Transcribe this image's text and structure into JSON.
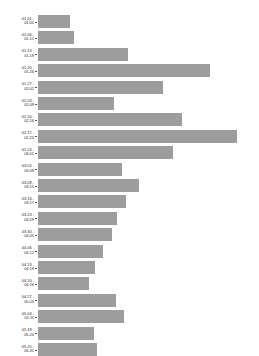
{
  "chart_data": {
    "type": "bar",
    "orientation": "horizontal",
    "title": "",
    "xlabel": "",
    "ylabel": "",
    "grid": false,
    "legend": null,
    "bar_color": "#9d9d9d",
    "background_color": "#ffffff",
    "xlim": [
      0,
      210
    ],
    "categories": [
      "01.01 -\n01.05",
      "01.06 -\n01.12",
      "01.13 -\n01.19",
      "01.20 -\n01.26",
      "01.27 -\n02.02",
      "02.03 -\n02.09",
      "02.10 -\n02.16",
      "02.17 -\n02.23",
      "02.24 -\n03.01",
      "03.02 -\n03.08",
      "03.09 -\n03.15",
      "03.16 -\n03.17",
      "03.23 -\n03.29",
      "03.30 -\n04.05",
      "04.06 -\n04.12",
      "04.13 -\n04.19",
      "04.20 -\n04.26",
      "04.27 -\n05.03",
      "05.04 -\n05.11",
      "05.18 -\n05.24",
      "05.25 -\n05.31"
    ],
    "values": [
      33,
      37,
      92,
      176,
      128,
      78,
      147,
      204,
      138,
      86,
      103,
      90,
      81,
      76,
      67,
      58,
      52,
      80,
      88,
      57,
      60
    ]
  }
}
